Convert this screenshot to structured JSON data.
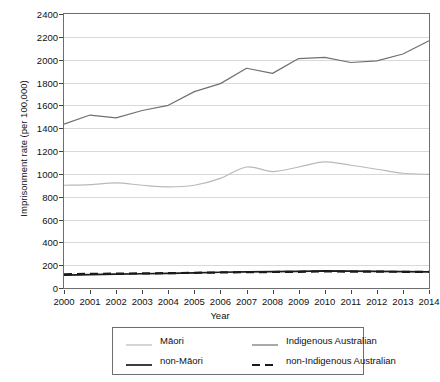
{
  "chart_data": {
    "type": "line",
    "title": "",
    "xlabel": "Year",
    "ylabel": "Imprisonment rate (per 100,000)",
    "x": [
      2000,
      2001,
      2002,
      2003,
      2004,
      2005,
      2006,
      2007,
      2008,
      2009,
      2010,
      2011,
      2012,
      2013,
      2014
    ],
    "categories": [
      "2000",
      "2001",
      "2002",
      "2003",
      "2004",
      "2005",
      "2006",
      "2007",
      "2008",
      "2009",
      "2010",
      "2011",
      "2012",
      "2013",
      "2014"
    ],
    "xlim": [
      2000,
      2014
    ],
    "ylim": [
      0,
      2400
    ],
    "yticks": [
      0,
      200,
      400,
      600,
      800,
      1000,
      1200,
      1400,
      1600,
      1800,
      2000,
      2200,
      2400
    ],
    "grid": true,
    "legend_position": "below",
    "series": [
      {
        "name": "Māori",
        "color": "#b9b9b9",
        "style": "solid",
        "values": [
          900,
          905,
          920,
          900,
          885,
          900,
          960,
          1060,
          1020,
          1060,
          1105,
          1075,
          1040,
          1005,
          995
        ]
      },
      {
        "name": "Indigenous Australian",
        "color": "#707070",
        "style": "solid",
        "values": [
          1435,
          1515,
          1490,
          1555,
          1600,
          1720,
          1790,
          1925,
          1880,
          2010,
          2020,
          1975,
          1990,
          2050,
          2165
        ]
      },
      {
        "name": "non-Māori",
        "color": "#1a1a1a",
        "style": "solid",
        "values": [
          112,
          118,
          122,
          125,
          128,
          133,
          138,
          142,
          143,
          146,
          150,
          148,
          146,
          144,
          142
        ]
      },
      {
        "name": "non-Indigenous Australian",
        "color": "#1a1a1a",
        "style": "dashed",
        "values": [
          120,
          124,
          126,
          128,
          130,
          133,
          136,
          139,
          140,
          142,
          145,
          144,
          143,
          142,
          141
        ]
      }
    ]
  },
  "legend": {
    "items": [
      {
        "label": "Māori",
        "color": "#b9b9b9",
        "style": "solid"
      },
      {
        "label": "Indigenous Australian",
        "color": "#707070",
        "style": "solid"
      },
      {
        "label": "non-Māori",
        "color": "#1a1a1a",
        "style": "solid"
      },
      {
        "label": "non-Indigenous Australian",
        "color": "#1a1a1a",
        "style": "dashed"
      }
    ]
  }
}
